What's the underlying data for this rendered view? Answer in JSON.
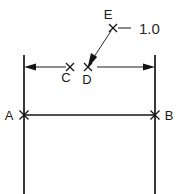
{
  "diagram": {
    "dimension_label": "1.0",
    "points": [
      {
        "id": "A",
        "label": "A",
        "x": 24,
        "y": 115,
        "marker": "x-marker"
      },
      {
        "id": "B",
        "label": "B",
        "x": 155,
        "y": 115,
        "marker": "x-marker"
      },
      {
        "id": "C",
        "label": "C",
        "x": 70,
        "y": 67,
        "marker": "x-marker"
      },
      {
        "id": "D",
        "label": "D",
        "x": 88,
        "y": 67,
        "marker": "x-marker"
      },
      {
        "id": "E",
        "label": "E",
        "x": 113,
        "y": 28,
        "marker": "x-marker"
      }
    ],
    "colors": {
      "line": "#141414",
      "thin_line": "#2b2b2b",
      "text": "#1a1a1a",
      "background": "#ffffff"
    }
  }
}
